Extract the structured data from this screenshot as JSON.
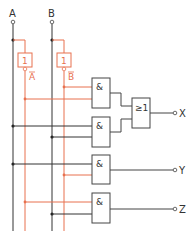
{
  "diagram": {
    "title": "",
    "colors": {
      "wire": "#333333",
      "inverted_wire": "#e8714f",
      "gate_border": "#444444",
      "background": "#ffffff"
    },
    "inputs": [
      {
        "id": "A",
        "label": "A"
      },
      {
        "id": "B",
        "label": "B"
      }
    ],
    "inverters": [
      {
        "id": "notA",
        "symbol": "1",
        "output_label": "A",
        "output_overbar": true,
        "input": "A"
      },
      {
        "id": "notB",
        "symbol": "1",
        "output_label": "B",
        "output_overbar": true,
        "input": "B"
      }
    ],
    "gates": [
      {
        "id": "and1",
        "type": "AND",
        "symbol": "&",
        "inputs": [
          "notB",
          "notA"
        ]
      },
      {
        "id": "and2",
        "type": "AND",
        "symbol": "&",
        "inputs": [
          "A",
          "B"
        ]
      },
      {
        "id": "or1",
        "type": "OR",
        "symbol": "≥1",
        "inputs": [
          "and1",
          "and2"
        ]
      },
      {
        "id": "and3",
        "type": "AND",
        "symbol": "&",
        "inputs": [
          "A",
          "notB"
        ]
      },
      {
        "id": "and4",
        "type": "AND",
        "symbol": "&",
        "inputs": [
          "notA",
          "B"
        ]
      }
    ],
    "outputs": [
      {
        "id": "X",
        "label": "X",
        "source": "or1"
      },
      {
        "id": "Y",
        "label": "Y",
        "source": "and3"
      },
      {
        "id": "Z",
        "label": "Z",
        "source": "and4"
      }
    ]
  }
}
